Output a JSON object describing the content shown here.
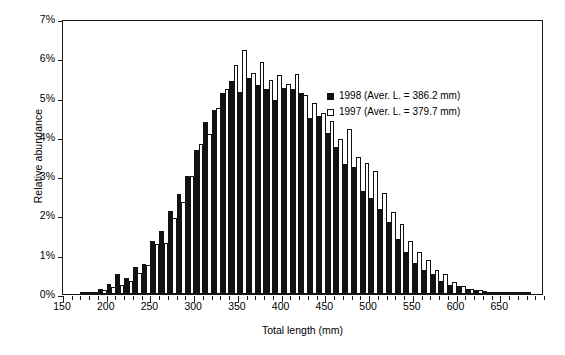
{
  "chart_data": {
    "type": "bar",
    "title": "",
    "xlabel": "Total length (mm)",
    "ylabel": "Relative abundance",
    "xlim": [
      150,
      700
    ],
    "ylim": [
      0,
      7
    ],
    "y_tick_labels": [
      "0%",
      "1%",
      "2%",
      "3%",
      "4%",
      "5%",
      "6%",
      "7%"
    ],
    "y_tick_values": [
      0,
      1,
      2,
      3,
      4,
      5,
      6,
      7
    ],
    "x_tick_labels": [
      "150",
      "200",
      "250",
      "300",
      "350",
      "400",
      "450",
      "500",
      "550",
      "600",
      "650"
    ],
    "x_tick_values": [
      150,
      200,
      250,
      300,
      350,
      400,
      450,
      500,
      550,
      600,
      650
    ],
    "x_minor_tick_step": 10,
    "grid": false,
    "bin_width": 10,
    "legend_position": "upper right",
    "categories": [
      155,
      165,
      175,
      185,
      195,
      205,
      215,
      225,
      235,
      245,
      255,
      265,
      275,
      285,
      295,
      305,
      315,
      325,
      335,
      345,
      355,
      365,
      375,
      385,
      395,
      405,
      415,
      425,
      435,
      445,
      455,
      465,
      475,
      485,
      495,
      505,
      515,
      525,
      535,
      545,
      555,
      565,
      575,
      585,
      595,
      605,
      615,
      625,
      635,
      645,
      655,
      665,
      675,
      685,
      695
    ],
    "series": [
      {
        "name": "1998 (Aver. L. = 386.2 mm)",
        "label": "1998",
        "mean_length_mm": 386.2,
        "color": "#121212",
        "fill": "solid",
        "values": [
          0.0,
          0.0,
          0.02,
          0.05,
          0.12,
          0.25,
          0.52,
          0.42,
          0.68,
          0.76,
          1.34,
          1.6,
          2.12,
          2.55,
          3.01,
          3.66,
          4.37,
          4.69,
          5.12,
          5.43,
          5.13,
          5.5,
          5.33,
          5.22,
          4.94,
          5.25,
          5.23,
          5.12,
          4.47,
          4.53,
          4.1,
          3.75,
          3.31,
          3.23,
          2.63,
          2.45,
          2.16,
          1.83,
          1.41,
          1.06,
          0.79,
          0.62,
          0.5,
          0.33,
          0.24,
          0.2,
          0.14,
          0.1,
          0.08,
          0.05,
          0.03,
          0.02,
          0.01,
          0.01,
          0.0
        ]
      },
      {
        "name": "1997 (Aver. L. = 379.7 mm)",
        "label": "1997",
        "mean_length_mm": 379.7,
        "color": "#ffffff",
        "fill": "open",
        "values": [
          0.0,
          0.0,
          0.01,
          0.03,
          0.09,
          0.18,
          0.23,
          0.32,
          0.54,
          0.74,
          1.27,
          1.3,
          1.93,
          2.34,
          3.0,
          3.83,
          4.07,
          4.74,
          5.23,
          5.83,
          6.21,
          5.62,
          5.9,
          5.44,
          5.58,
          5.35,
          5.6,
          5.07,
          4.86,
          4.62,
          4.4,
          3.94,
          4.19,
          3.48,
          3.33,
          3.12,
          2.57,
          2.08,
          1.78,
          1.34,
          1.06,
          0.86,
          0.62,
          0.5,
          0.3,
          0.2,
          0.13,
          0.1,
          0.06,
          0.04,
          0.03,
          0.02,
          0.01,
          0.0,
          0.0
        ]
      }
    ]
  },
  "legend": {
    "items": [
      {
        "label": "1998 (Aver. L. = 386.2 mm)",
        "swatch": "filled-square"
      },
      {
        "label": "1997 (Aver. L. = 379.7 mm)",
        "swatch": "open-square"
      }
    ]
  },
  "axes": {
    "x_title": "Total length (mm)",
    "y_title": "Relative abundance"
  }
}
